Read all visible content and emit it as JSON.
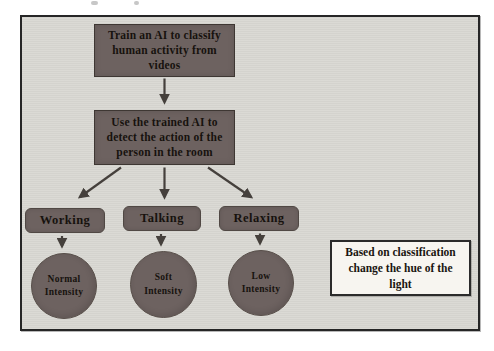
{
  "colors": {
    "page_bg": "#ffffff",
    "canvas_bg": "#d9d8d3",
    "canvas_border": "#262626",
    "node_fill": "#6d6260",
    "node_border": "#3e3733",
    "node_text": "#17120e",
    "arrow": "#45403c",
    "note_bg": "#f7f5f0",
    "note_border": "#2b2b2b"
  },
  "flowchart": {
    "step1_lines": [
      "Train an AI to classify",
      "human activity from",
      "videos"
    ],
    "step2_lines": [
      "Use the trained AI to",
      "detect the action of the",
      "person in the room"
    ],
    "categories": [
      {
        "label": "Working",
        "result": "Normal Intensity"
      },
      {
        "label": "Talking",
        "result": "Soft Intensity"
      },
      {
        "label": "Relaxing",
        "result": "Low Intensity"
      }
    ],
    "note_lines": [
      "Based on classification",
      "change the hue of the",
      "light"
    ]
  }
}
